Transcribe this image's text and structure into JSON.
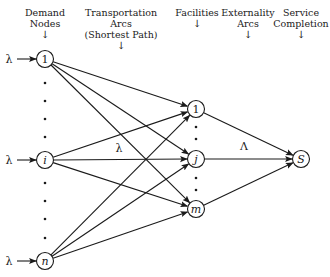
{
  "headers": [
    {
      "id": "demand",
      "lines": [
        "Demand",
        "Nodes"
      ],
      "arrow": "↓",
      "x": 45,
      "y": 7
    },
    {
      "id": "transport",
      "lines": [
        "Transportation",
        "Arcs",
        "(Shortest Path)"
      ],
      "arrow": "↓",
      "x": 121,
      "y": 7
    },
    {
      "id": "facilities",
      "lines": [
        "Facilities"
      ],
      "arrow": "↓",
      "x": 197,
      "y": 7
    },
    {
      "id": "externality",
      "lines": [
        "Externality",
        "Arcs"
      ],
      "arrow": "↓",
      "x": 248,
      "y": 7
    },
    {
      "id": "service",
      "lines": [
        "Service",
        "Completion"
      ],
      "arrow": "↓",
      "x": 301,
      "y": 7
    }
  ],
  "demand_nodes": [
    {
      "id": "d1",
      "label": "1",
      "italic": false,
      "x": 45,
      "y": 59,
      "input_label": "λ"
    },
    {
      "id": "di",
      "label": "i",
      "italic": true,
      "x": 45,
      "y": 160,
      "input_label": "λ"
    },
    {
      "id": "dn",
      "label": "n",
      "italic": true,
      "x": 45,
      "y": 261,
      "input_label": "λ"
    }
  ],
  "facility_nodes": [
    {
      "id": "f1",
      "label": "1",
      "italic": false,
      "x": 196,
      "y": 109
    },
    {
      "id": "fj",
      "label": "j",
      "italic": true,
      "x": 196,
      "y": 159
    },
    {
      "id": "fm",
      "label": "m",
      "italic": true,
      "x": 196,
      "y": 209
    }
  ],
  "sink_node": {
    "id": "S",
    "label": "S",
    "italic": true,
    "x": 301,
    "y": 159
  },
  "arc_labels": {
    "transport": {
      "text": "λ",
      "x": 119,
      "y": 152
    },
    "externality": {
      "text": "Λ",
      "x": 244,
      "y": 150
    }
  },
  "ellipsis_dots": {
    "demand_upper": [
      [
        45,
        83
      ],
      [
        45,
        101
      ],
      [
        45,
        119
      ],
      [
        45,
        137
      ]
    ],
    "demand_lower": [
      [
        45,
        183
      ],
      [
        45,
        201
      ],
      [
        45,
        219
      ],
      [
        45,
        238
      ]
    ],
    "facility_upper": [
      [
        196,
        127
      ],
      [
        196,
        139
      ]
    ],
    "facility_lower": [
      [
        196,
        178
      ],
      [
        196,
        190
      ]
    ]
  },
  "style": {
    "stroke": "#1a1a1a",
    "background": "#ffffff"
  }
}
